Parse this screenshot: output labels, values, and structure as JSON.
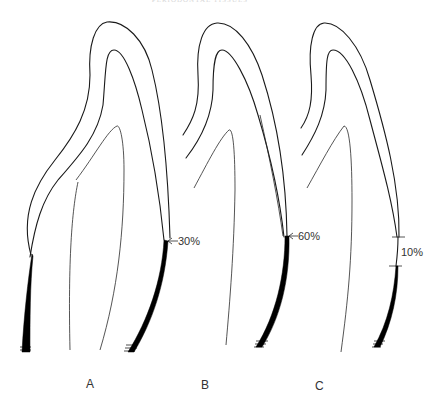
{
  "header": {
    "title": "PERIODONTAL TISSUES"
  },
  "panels": [
    {
      "label": "A",
      "percent_label": "30%",
      "marker": "arrow"
    },
    {
      "label": "B",
      "percent_label": "60%",
      "marker": "arrow"
    },
    {
      "label": "C",
      "percent_label": "10%",
      "marker": "bracket-ticks"
    }
  ],
  "colors": {
    "line": "#1a1a1a",
    "band": "#000000",
    "text": "#333333",
    "background": "#ffffff"
  }
}
